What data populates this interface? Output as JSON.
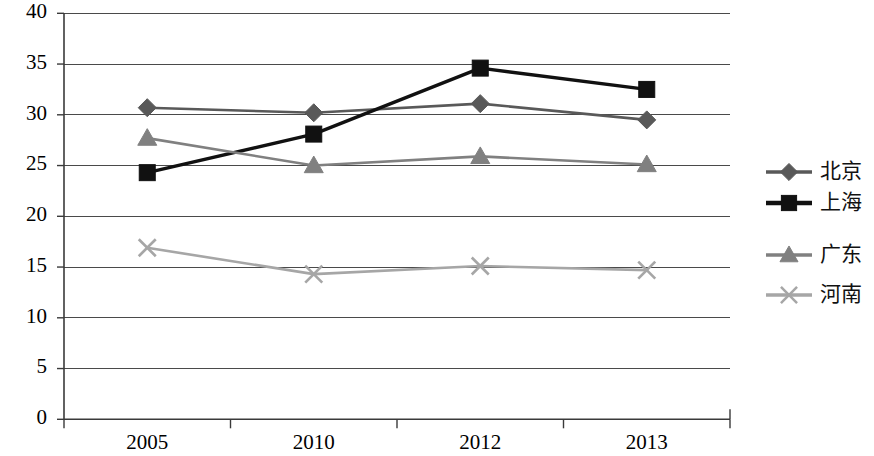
{
  "chart_data": {
    "type": "line",
    "title": "",
    "subtitle": "",
    "xlabel": "",
    "ylabel": "",
    "categories": [
      "2005",
      "2010",
      "2012",
      "2013"
    ],
    "ylim": [
      0,
      40
    ],
    "ytick_step": 5,
    "ytick_labels": [
      "40",
      "35",
      "30",
      "25",
      "20",
      "15",
      "10",
      "5",
      "0"
    ],
    "ytick_values": [
      40,
      35,
      30,
      25,
      20,
      15,
      10,
      5,
      0
    ],
    "grid": "horizontal",
    "legend_position": "right",
    "series": [
      {
        "name": "北京",
        "marker": "diamond",
        "color": "#595959",
        "line_color": "#595959",
        "values": [
          30.7,
          30.2,
          31.1,
          29.5
        ]
      },
      {
        "name": "上海",
        "marker": "square",
        "color": "#111111",
        "line_color": "#111111",
        "values": [
          24.3,
          28.1,
          34.6,
          32.5
        ]
      },
      {
        "name": "广东",
        "marker": "triangle",
        "color": "#808080",
        "line_color": "#808080",
        "values": [
          27.7,
          25.0,
          25.9,
          25.1
        ]
      },
      {
        "name": "河南",
        "marker": "cross",
        "color": "#a6a6a6",
        "line_color": "#a6a6a6",
        "values": [
          16.9,
          14.3,
          15.1,
          14.7
        ]
      }
    ]
  },
  "legend": {
    "entries": [
      "北京",
      "上海",
      "广东",
      "河南"
    ]
  },
  "colors": {
    "background": "#ffffff",
    "axis": "#3a3a3a",
    "grid": "#4a4a4a",
    "series_1": "#595959",
    "series_2": "#111111",
    "series_3": "#808080",
    "series_4": "#a6a6a6"
  }
}
